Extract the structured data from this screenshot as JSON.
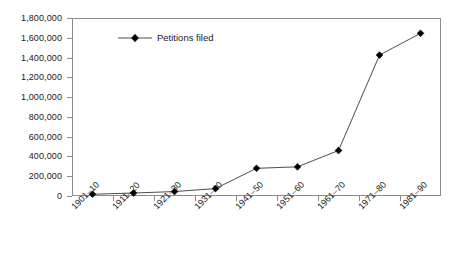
{
  "chart_data": {
    "type": "line",
    "title": "",
    "subtitle": "",
    "xlabel": "",
    "ylabel": "",
    "categories": [
      "1901–10",
      "1911–20",
      "1921–30",
      "1931–40",
      "1941–50",
      "1951–60",
      "1961–70",
      "1971–80",
      "1981–90"
    ],
    "series": [
      {
        "name": "Petitions filed",
        "values": [
          18000,
          30000,
          45000,
          75000,
          280000,
          295000,
          460000,
          1425000,
          1645000
        ],
        "color": "#000000",
        "line_color": "#4d4d4d",
        "marker": "diamond"
      }
    ],
    "ylim": [
      0,
      1800000
    ],
    "ytick_values": [
      0,
      200000,
      400000,
      600000,
      800000,
      1000000,
      1200000,
      1400000,
      1600000,
      1800000
    ],
    "ytick_labels": [
      "0",
      "200,000",
      "400,000",
      "600,000",
      "800,000",
      "1,000,000",
      "1,200,000",
      "1,400,000",
      "1,600,000",
      "1,800,000"
    ],
    "grid": false,
    "legend_position": "inside-top-left",
    "xtick_label_rotation": -45,
    "frame": true,
    "frame_color": "#8c8c8c"
  },
  "legend": {
    "entries": [
      {
        "label": "Petitions filed",
        "marker": "diamond-marker",
        "color": "#000000"
      }
    ]
  }
}
